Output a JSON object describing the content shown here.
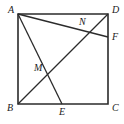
{
  "figure": {
    "kind": "geometry-diagram",
    "canvas": {
      "width": 124,
      "height": 124,
      "background": "#ffffff"
    },
    "style": {
      "stroke_color": "#2b2b2b",
      "square_stroke_width": 1.6,
      "line_stroke_width": 1.3,
      "label_color": "#1a1a1a",
      "label_font_size": 10
    },
    "points": [
      {
        "id": "A",
        "label": "A",
        "x": 18,
        "y": 14,
        "label_x": 8,
        "label_y": 13,
        "on": "square-vertex-top-left"
      },
      {
        "id": "D",
        "label": "D",
        "x": 108,
        "y": 14,
        "label_x": 112,
        "label_y": 13,
        "on": "square-vertex-top-right"
      },
      {
        "id": "B",
        "label": "B",
        "x": 18,
        "y": 104,
        "label_x": 7,
        "label_y": 111,
        "on": "square-vertex-bottom-left"
      },
      {
        "id": "C",
        "label": "C",
        "x": 108,
        "y": 104,
        "label_x": 112,
        "label_y": 111,
        "on": "square-vertex-bottom-right"
      },
      {
        "id": "E",
        "label": "E",
        "x": 62,
        "y": 104,
        "label_x": 59,
        "label_y": 115,
        "on": "side-BC"
      },
      {
        "id": "F",
        "label": "F",
        "x": 108,
        "y": 37,
        "label_x": 112,
        "label_y": 40,
        "on": "side-DC"
      },
      {
        "id": "M",
        "label": "M",
        "x": 48,
        "y": 73,
        "label_x": 34,
        "label_y": 71,
        "on": "intersection-AE-BD"
      },
      {
        "id": "N",
        "label": "N",
        "x": 85,
        "y": 28,
        "label_x": 79,
        "label_y": 25,
        "on": "intersection-AF-BD"
      }
    ],
    "square": {
      "name": "ABCD",
      "vertices": [
        "A",
        "D",
        "C",
        "B"
      ],
      "path": "18,14 108,14 108,104 18,104"
    },
    "segments": [
      {
        "id": "seg-AF",
        "from": "A",
        "to": "F",
        "label": "AF"
      },
      {
        "id": "seg-AE",
        "from": "A",
        "to": "E",
        "label": "AE"
      },
      {
        "id": "seg-BD",
        "from": "B",
        "to": "D",
        "label": "BD"
      }
    ]
  }
}
